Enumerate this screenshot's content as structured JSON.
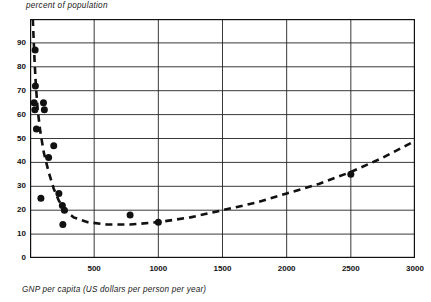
{
  "chart_data": {
    "type": "scatter",
    "title": "",
    "ylabel": "percent of population",
    "xlabel": "GNP per capita (US dollars per person per year)",
    "xlim": [
      0,
      3000
    ],
    "ylim": [
      0,
      100
    ],
    "xticks": [
      500,
      1000,
      1500,
      2000,
      2500,
      3000
    ],
    "xtick_labels": [
      "500",
      "1000",
      "1500",
      "2000",
      "2500",
      "3000"
    ],
    "yticks": [
      0,
      10,
      20,
      30,
      40,
      50,
      60,
      70,
      80,
      90
    ],
    "ytick_labels": [
      "0",
      "10",
      "20",
      "30",
      "40",
      "50",
      "60",
      "70",
      "80",
      "90"
    ],
    "grid": true,
    "grid_color": "#222222",
    "frame_color": "#111111",
    "marker_color": "#111111",
    "marker_shape": "circle",
    "marker_size_px": 7,
    "legend": null,
    "series": [
      {
        "name": "observations",
        "type": "scatter",
        "points": [
          {
            "x": 40,
            "y": 87
          },
          {
            "x": 42,
            "y": 72
          },
          {
            "x": 32,
            "y": 65
          },
          {
            "x": 105,
            "y": 65
          },
          {
            "x": 38,
            "y": 62
          },
          {
            "x": 112,
            "y": 62
          },
          {
            "x": 50,
            "y": 54
          },
          {
            "x": 185,
            "y": 47
          },
          {
            "x": 145,
            "y": 42
          },
          {
            "x": 85,
            "y": 25
          },
          {
            "x": 225,
            "y": 27
          },
          {
            "x": 252,
            "y": 22
          },
          {
            "x": 268,
            "y": 20
          },
          {
            "x": 256,
            "y": 14
          },
          {
            "x": 780,
            "y": 18
          },
          {
            "x": 1000,
            "y": 15
          },
          {
            "x": 2500,
            "y": 35
          }
        ]
      },
      {
        "name": "fitted trend",
        "type": "line",
        "style": "dashed",
        "points": [
          {
            "x": 22,
            "y": 100
          },
          {
            "x": 28,
            "y": 92
          },
          {
            "x": 36,
            "y": 82
          },
          {
            "x": 46,
            "y": 72
          },
          {
            "x": 60,
            "y": 62
          },
          {
            "x": 80,
            "y": 53
          },
          {
            "x": 108,
            "y": 44
          },
          {
            "x": 145,
            "y": 36
          },
          {
            "x": 185,
            "y": 29
          },
          {
            "x": 225,
            "y": 24
          },
          {
            "x": 270,
            "y": 20
          },
          {
            "x": 340,
            "y": 17
          },
          {
            "x": 450,
            "y": 15
          },
          {
            "x": 600,
            "y": 14
          },
          {
            "x": 780,
            "y": 14
          },
          {
            "x": 1000,
            "y": 15
          },
          {
            "x": 1250,
            "y": 17
          },
          {
            "x": 1500,
            "y": 20
          },
          {
            "x": 1750,
            "y": 23
          },
          {
            "x": 2000,
            "y": 27
          },
          {
            "x": 2250,
            "y": 31
          },
          {
            "x": 2500,
            "y": 36
          },
          {
            "x": 2750,
            "y": 42
          },
          {
            "x": 3000,
            "y": 49
          }
        ]
      }
    ]
  }
}
